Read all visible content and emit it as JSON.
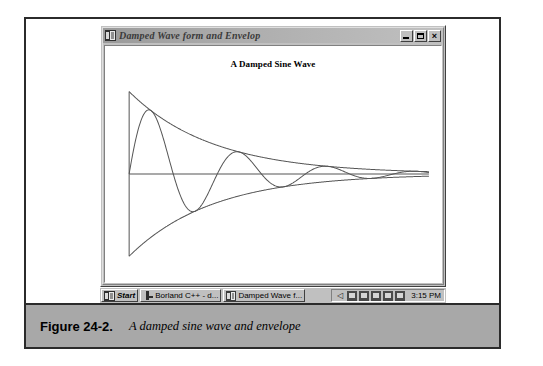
{
  "figure": {
    "label": "Figure 24-2.",
    "caption": "A damped sine wave and envelope"
  },
  "window": {
    "title": "Damped Wave form and Envelop",
    "icon": "application-icon",
    "controls": {
      "minimize": "_",
      "maximize": "□",
      "close": "×"
    }
  },
  "chart_title": "A Damped Sine Wave",
  "taskbar": {
    "start_label": "Start",
    "items": [
      {
        "label": "Borland C++ - d...",
        "icon": "borland-icon"
      },
      {
        "label": "Damped Wave f...",
        "icon": "wave-app-icon"
      }
    ],
    "tray_icons": [
      "speaker-icon",
      "display-icon",
      "network-icon",
      "modem-icon",
      "printer-icon",
      "battery-icon"
    ],
    "time": "3:15 PM"
  },
  "chart_data": {
    "type": "line",
    "title": "A Damped Sine Wave",
    "xlabel": "",
    "ylabel": "",
    "grid": false,
    "legend": null,
    "xlim": [
      0,
      1
    ],
    "ylim": [
      -1,
      1
    ],
    "axis_origin_fraction": {
      "x": 0.0,
      "y": 0.5
    },
    "decay_constant": 3.6,
    "cycles": 3.4,
    "series": [
      {
        "name": "damped sine wave",
        "formula": "y = exp(-3.6x) * sin(2*pi*3.4*x)",
        "points_x": [
          0.0,
          0.02,
          0.04,
          0.06,
          0.08,
          0.1,
          0.12,
          0.14,
          0.16,
          0.18,
          0.2,
          0.22,
          0.24,
          0.26,
          0.28,
          0.3,
          0.32,
          0.34,
          0.36,
          0.38,
          0.4,
          0.42,
          0.44,
          0.46,
          0.48,
          0.5,
          0.55,
          0.6,
          0.65,
          0.7,
          0.75,
          0.8,
          0.85,
          0.9,
          0.95,
          1.0
        ],
        "points_y": [
          0.0,
          0.38,
          0.68,
          0.85,
          0.89,
          0.8,
          0.6,
          0.33,
          0.04,
          -0.24,
          -0.46,
          -0.59,
          -0.62,
          -0.56,
          -0.42,
          -0.23,
          -0.03,
          0.16,
          0.31,
          0.4,
          0.43,
          0.4,
          0.32,
          0.21,
          0.08,
          -0.05,
          -0.26,
          -0.25,
          -0.07,
          0.13,
          0.19,
          0.09,
          -0.06,
          -0.13,
          -0.08,
          0.02
        ]
      },
      {
        "name": "upper envelope",
        "formula": "y = exp(-3.6x)",
        "points_x": [
          0.0,
          0.1,
          0.2,
          0.3,
          0.4,
          0.5,
          0.6,
          0.7,
          0.8,
          0.9,
          1.0
        ],
        "points_y": [
          1.0,
          0.7,
          0.49,
          0.34,
          0.24,
          0.17,
          0.12,
          0.08,
          0.06,
          0.04,
          0.03
        ]
      },
      {
        "name": "lower envelope",
        "formula": "y = -exp(-3.6x)",
        "points_x": [
          0.0,
          0.1,
          0.2,
          0.3,
          0.4,
          0.5,
          0.6,
          0.7,
          0.8,
          0.9,
          1.0
        ],
        "points_y": [
          -1.0,
          -0.7,
          -0.49,
          -0.34,
          -0.24,
          -0.17,
          -0.12,
          -0.08,
          -0.06,
          -0.04,
          -0.03
        ]
      }
    ],
    "axes": [
      {
        "name": "x-axis",
        "from": [
          0,
          0
        ],
        "to": [
          1,
          0
        ]
      },
      {
        "name": "y-axis",
        "from": [
          0,
          -1
        ],
        "to": [
          0,
          1
        ]
      }
    ]
  },
  "colors": {
    "window_face": "#c0c0c0",
    "titlebar": "#9a9a9a",
    "plot_background": "#ffffff",
    "curve": "#555555",
    "caption_band": "#a8a8a8",
    "frame": "#2b2b2b"
  }
}
